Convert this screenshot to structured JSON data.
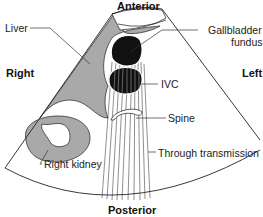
{
  "diagram": {
    "type": "ultrasound-transverse-section",
    "orientation": {
      "top": "Anterior",
      "bottom": "Posterior",
      "left": "Right",
      "right": "Left"
    },
    "labels": {
      "liver": "Liver",
      "gallbladder_line1": "Gallbladder",
      "gallbladder_line2": "fundus",
      "ivc": "IVC",
      "spine": "Spine",
      "through_transmission": "Through transmission",
      "right_kidney": "Right kidney"
    },
    "colors": {
      "tissue_gray": "#a9a9a9",
      "fluid_black": "#111111",
      "outline": "#333333",
      "background": "#ffffff"
    }
  }
}
